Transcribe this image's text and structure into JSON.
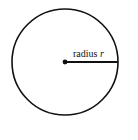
{
  "diagram": {
    "shape": "circle",
    "label": {
      "text": "radius",
      "variable": "r"
    },
    "colors": {
      "stroke": "#111111",
      "background": "#ffffff"
    }
  }
}
